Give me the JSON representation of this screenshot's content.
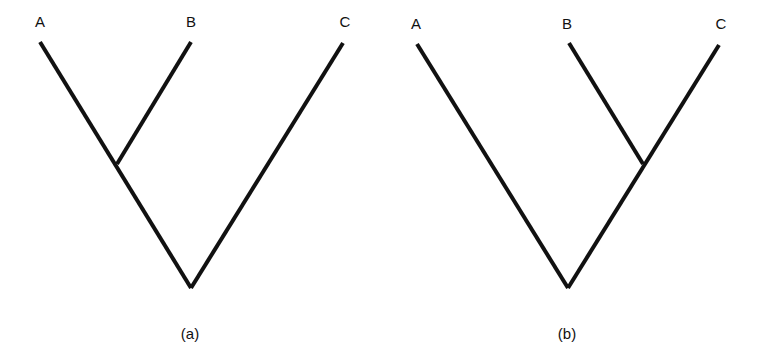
{
  "diagram": {
    "type": "phylogenetic-trees",
    "line_color": "#111111",
    "trees": [
      {
        "caption": "(a)",
        "topology": "((A,B),C)",
        "leaves": [
          {
            "label": "A",
            "x": 40,
            "y": 42,
            "label_x": 40,
            "label_y": 21
          },
          {
            "label": "B",
            "x": 191,
            "y": 42,
            "label_x": 191,
            "label_y": 21
          },
          {
            "label": "C",
            "x": 343,
            "y": 43,
            "label_x": 345,
            "label_y": 21
          }
        ],
        "internal_node": {
          "x": 117,
          "y": 164
        },
        "root": {
          "x": 191,
          "y": 288
        },
        "caption_x": 190,
        "caption_y": 333
      },
      {
        "caption": "(b)",
        "topology": "(A,(B,C))",
        "leaves": [
          {
            "label": "A",
            "x": 417,
            "y": 44,
            "label_x": 416,
            "label_y": 23
          },
          {
            "label": "B",
            "x": 569,
            "y": 43,
            "label_x": 567,
            "label_y": 23
          },
          {
            "label": "C",
            "x": 719,
            "y": 45,
            "label_x": 721,
            "label_y": 23
          }
        ],
        "internal_node": {
          "x": 643,
          "y": 164
        },
        "root": {
          "x": 568,
          "y": 288
        },
        "caption_x": 567,
        "caption_y": 333
      }
    ]
  }
}
